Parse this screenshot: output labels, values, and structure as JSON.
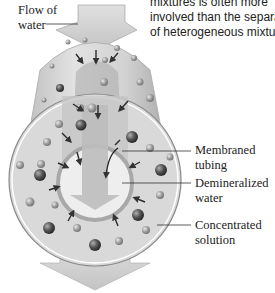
{
  "caption": {
    "lines": [
      "mixtures is often more",
      "involved than the separati",
      "of heterogeneous mixture"
    ]
  },
  "labels": {
    "flow_of_water": [
      "Flow of",
      "water"
    ],
    "membraned_tubing": [
      "Membraned",
      "tubing"
    ],
    "demineralized_water": [
      "Demineralized",
      "water"
    ],
    "concentrated_solution": [
      "Concentrated",
      "solution"
    ]
  },
  "colors": {
    "background": "#ffffff",
    "tube_body": "#cfcfcf",
    "tube_light": "#e6e6e6",
    "arrow_fill": "#bdbdbd",
    "particle_dark": "#555555",
    "particle_light": "#9a9a9a",
    "leader_line": "#333333",
    "text": "#222222"
  }
}
